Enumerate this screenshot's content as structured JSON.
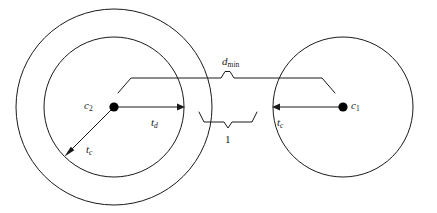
{
  "figure": {
    "type": "geometry-diagram",
    "background_color": "#ffffff",
    "stroke_color": "#1a1a1a",
    "width": 437,
    "height": 213
  },
  "labels": {
    "center_left": {
      "symbol": "c",
      "subscript": "2",
      "name": "c2"
    },
    "center_right": {
      "symbol": "c",
      "subscript": "1",
      "name": "c1"
    },
    "radius_left": {
      "symbol": "t",
      "subscript": "d",
      "name": "td"
    },
    "tolerance_left": {
      "symbol": "t",
      "subscript": "c",
      "name": "tc"
    },
    "tolerance_right": {
      "symbol": "t",
      "subscript": "c",
      "name": "tc"
    },
    "min_distance": {
      "symbol": "d",
      "subscript": "min",
      "name": "dmin"
    },
    "gap": {
      "symbol": "1",
      "name": "one"
    }
  },
  "geometry": {
    "left_circle": {
      "cx": 114,
      "cy": 107,
      "r_inner": 70,
      "r_outer": 98
    },
    "right_circle": {
      "cx": 343,
      "cy": 107,
      "r": 70
    },
    "dot_radius": 4.5,
    "td_arrow": {
      "x1": 114,
      "y1": 107,
      "x2": 184,
      "y2": 107
    },
    "tc_right_arrow": {
      "x1": 343,
      "y1": 107,
      "x2": 273,
      "y2": 107
    },
    "tc_left_arrow": {
      "x1": 114,
      "y1": 107,
      "x2": 65,
      "y2": 156
    },
    "top_brace": {
      "x_left": 131,
      "x_right": 322,
      "y": 78,
      "tip_x": 228,
      "tip_y": 70
    },
    "bottom_brace": {
      "x_left": 202,
      "x_right": 255,
      "y": 122,
      "tip_x": 228,
      "tip_y": 129
    }
  }
}
